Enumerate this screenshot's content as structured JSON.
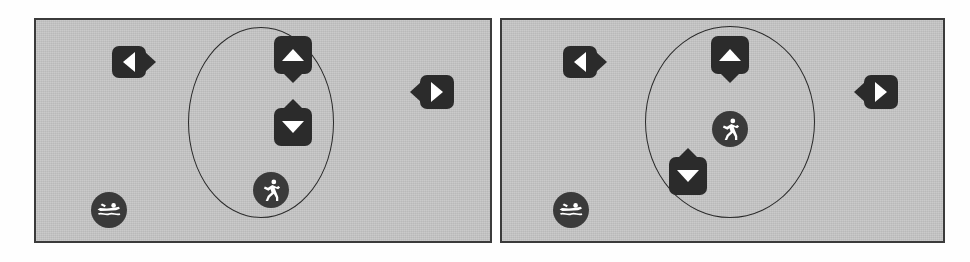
{
  "scene": {
    "title": "Two-panel simulation view",
    "background_color": "#fefefe",
    "panel_fill": "#c6c6c6",
    "panel_border_color": "#3b3b3b",
    "marker_color": "#2b2b2b",
    "glyph_color": "#ffffff",
    "region_outline_color": "#2a2a2a"
  },
  "panels": [
    {
      "id": "left-panel",
      "label": "Left view",
      "x": 34,
      "y": 18,
      "width": 458,
      "height": 225,
      "region": {
        "name": "selection-ellipse",
        "shape": "ellipse",
        "x": 152,
        "y": 7,
        "width": 146,
        "height": 191
      },
      "markers": [
        {
          "id": "left-arrow-marker",
          "icon": "arrow-left-pin",
          "direction": "left",
          "x": 76,
          "y": 26,
          "width": 34,
          "height": 32
        },
        {
          "id": "up-arrow-marker",
          "icon": "arrow-up-pin",
          "direction": "up",
          "x": 238,
          "y": 16,
          "width": 38,
          "height": 38
        },
        {
          "id": "down-arrow-marker",
          "icon": "arrow-down-pin",
          "direction": "down",
          "x": 238,
          "y": 88,
          "width": 38,
          "height": 38
        },
        {
          "id": "right-arrow-marker",
          "icon": "arrow-right-pin",
          "direction": "right",
          "x": 384,
          "y": 55,
          "width": 34,
          "height": 34
        }
      ],
      "agents": [
        {
          "id": "runner-agent",
          "icon": "runner-icon",
          "x": 217,
          "y": 152,
          "size": 36
        },
        {
          "id": "swimmer-agent",
          "icon": "swimmer-icon",
          "x": 55,
          "y": 172,
          "size": 36
        }
      ]
    },
    {
      "id": "right-panel",
      "label": "Right view",
      "x": 500,
      "y": 18,
      "width": 445,
      "height": 225,
      "region": {
        "name": "selection-circle",
        "shape": "circle",
        "x": 143,
        "y": 6,
        "width": 170,
        "height": 192
      },
      "markers": [
        {
          "id": "left-arrow-marker",
          "icon": "arrow-left-pin",
          "direction": "left",
          "x": 61,
          "y": 26,
          "width": 34,
          "height": 32
        },
        {
          "id": "up-arrow-marker",
          "icon": "arrow-up-pin",
          "direction": "up",
          "x": 209,
          "y": 16,
          "width": 38,
          "height": 38
        },
        {
          "id": "down-arrow-marker",
          "icon": "arrow-down-pin",
          "direction": "down",
          "x": 167,
          "y": 137,
          "width": 38,
          "height": 38
        },
        {
          "id": "right-arrow-marker",
          "icon": "arrow-right-pin",
          "direction": "right",
          "x": 362,
          "y": 55,
          "width": 34,
          "height": 34
        }
      ],
      "agents": [
        {
          "id": "runner-agent",
          "icon": "runner-icon",
          "x": 210,
          "y": 91,
          "size": 36
        },
        {
          "id": "swimmer-agent",
          "icon": "swimmer-icon",
          "x": 51,
          "y": 172,
          "size": 36
        }
      ]
    }
  ]
}
